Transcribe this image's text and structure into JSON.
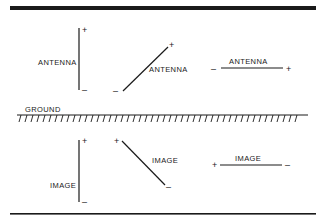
{
  "diagram": {
    "ground_label": "GROUND",
    "antennas": {
      "vertical": {
        "label": "ANTENNA",
        "top_sign": "+",
        "bottom_sign": "–"
      },
      "diagonal": {
        "label": "ANTENNA",
        "top_sign": "+",
        "bottom_sign": "–"
      },
      "horizontal": {
        "label": "ANTENNA",
        "left_sign": "–",
        "right_sign": "+"
      }
    },
    "images": {
      "vertical": {
        "label": "IMAGE",
        "top_sign": "+",
        "bottom_sign": "–"
      },
      "diagonal": {
        "label": "IMAGE",
        "top_sign": "+",
        "bottom_sign": "–"
      },
      "horizontal": {
        "label": "IMAGE",
        "left_sign": "+",
        "right_sign": "–"
      }
    },
    "colors": {
      "ink": "#1a1a1a",
      "background": "#ffffff"
    }
  }
}
